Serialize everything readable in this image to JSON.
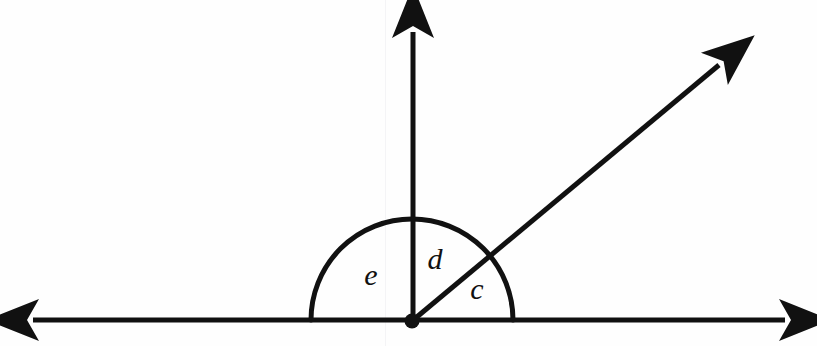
{
  "figure": {
    "background_color": "#fefefe",
    "stroke_color": "#111111",
    "canvas": {
      "width": 817,
      "height": 346
    }
  },
  "vertex": {
    "name": "origin-vertex",
    "x": 412,
    "y": 321,
    "radius": 7.5,
    "filled": true
  },
  "rays": [
    {
      "id": "horizontal-line",
      "kind": "double-arrow-line",
      "x1": 33,
      "y1": 320,
      "x2": 785,
      "y2": 320,
      "stroke_width": 5,
      "arrow_start": true,
      "arrow_end": true
    },
    {
      "id": "vertical-ray",
      "kind": "ray",
      "x1": 413,
      "y1": 321,
      "x2": 413,
      "y2": 32,
      "stroke_width": 5,
      "arrow_start": false,
      "arrow_end": true
    },
    {
      "id": "diagonal-ray",
      "kind": "ray",
      "x1": 412,
      "y1": 321,
      "x2": 719,
      "y2": 65,
      "stroke_width": 5,
      "arrow_start": false,
      "arrow_end": true,
      "angle_degrees": 40
    }
  ],
  "arc": {
    "id": "angle-arc",
    "center_x": 412,
    "center_y": 320,
    "radius": 101,
    "start_angle_degrees": 0,
    "end_angle_degrees": 180,
    "stroke_width": 5,
    "filled": false
  },
  "labels": [
    {
      "id": "label-e",
      "text": "e",
      "x": 371,
      "y": 278
    },
    {
      "id": "label-d",
      "text": "d",
      "x": 435,
      "y": 262
    },
    {
      "id": "label-c",
      "text": "c",
      "x": 477,
      "y": 292
    }
  ],
  "artifacts": {
    "scan_line_x": 385,
    "scan_line_color": "#f4f4f6"
  }
}
